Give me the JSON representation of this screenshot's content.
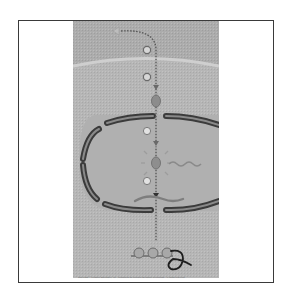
{
  "figure": {
    "steps": [
      {
        "label": "1",
        "stage": "signal-reception"
      },
      {
        "label": "2",
        "stage": "transduction-cytoplasm"
      },
      {
        "label": "3",
        "stage": "nuclear-entry"
      },
      {
        "label": "4",
        "stage": "transcription-activation"
      }
    ],
    "regions": [
      "extracellular-space",
      "plasma-membrane",
      "cytoplasm",
      "nuclear-envelope",
      "nucleus"
    ],
    "elements": [
      "signal-molecule",
      "transducer-protein",
      "transcription-factor",
      "DNA",
      "mRNA",
      "ribosomes",
      "polypeptide"
    ],
    "credit": "Copyright © Pearson Education, Inc., publishing as Pearson Benjamin Cummings. All rights reserved."
  },
  "colors": {
    "background": "#ffffff",
    "frame_border": "#3a3a3a",
    "panel_outer": "#aaaaaa",
    "panel_cytoplasm": "#b8b8b8",
    "membrane_line": "#cfcfcf",
    "nucleus_fill": "#b3b3b3",
    "envelope": "#3b3b3b",
    "envelope_inner": "#8a8a8a",
    "pathway": "#5a5a5a",
    "protein": "#8c8c8c",
    "polypeptide": "#1e1e1e"
  }
}
